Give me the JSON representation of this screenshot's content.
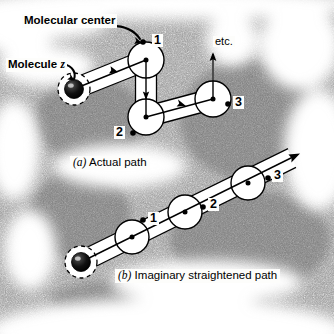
{
  "figure": {
    "background_color": "#ffffff",
    "ink_color": "#000000"
  },
  "callouts": [
    {
      "id": "molecular-center",
      "text": "Molecular center",
      "x": 22,
      "y": 14
    },
    {
      "id": "molecule-z",
      "text": "Molecule ",
      "italic_suffix": "z",
      "x": 6,
      "y": 58
    },
    {
      "id": "etc",
      "text": "etc.",
      "x": 213,
      "y": 36
    }
  ],
  "captions": [
    {
      "id": "panel-a",
      "marker": "(a)",
      "text": " Actual path",
      "x": 70,
      "y": 156
    },
    {
      "id": "panel-b",
      "marker": "(b)",
      "text": " Imaginary straightened path",
      "x": 115,
      "y": 269
    }
  ],
  "panel_a": {
    "name": "actual-path",
    "molecule": {
      "cx": 74,
      "cy": 89,
      "r": 9.5,
      "halo_r": 16
    },
    "nodes": [
      {
        "label": "1",
        "cx": 146,
        "cy": 60,
        "r": 18,
        "dot_x": 143,
        "dot_y": 42,
        "label_x": 152,
        "label_y": 34
      },
      {
        "label": "2",
        "cx": 146,
        "cy": 117,
        "r": 18,
        "dot_x": 133,
        "dot_y": 133,
        "label_x": 114,
        "label_y": 126
      },
      {
        "label": "3",
        "cx": 213,
        "cy": 99,
        "r": 18,
        "dot_x": 228,
        "dot_y": 104,
        "label_x": 233,
        "label_y": 96
      }
    ],
    "segments": [
      {
        "from": "molecule",
        "to": "1",
        "arrow": true
      },
      {
        "from": "1",
        "to": "2",
        "arrow": true
      },
      {
        "from": "2",
        "to": "3",
        "arrow": true
      },
      {
        "from": "3",
        "to": "etc",
        "arrow": true
      }
    ]
  },
  "panel_b": {
    "name": "imaginary-straightened-path",
    "molecule": {
      "cx": 81,
      "cy": 262,
      "r": 9.5,
      "halo_r": 16
    },
    "nodes": [
      {
        "label": "1",
        "cx": 132,
        "cy": 237,
        "r": 17,
        "dot_x": 143,
        "dot_y": 220,
        "label_x": 148,
        "label_y": 212
      },
      {
        "label": "2",
        "cx": 185,
        "cy": 212,
        "r": 17,
        "dot_x": 203,
        "dot_y": 207,
        "label_x": 208,
        "label_y": 198
      },
      {
        "label": "3",
        "cx": 248,
        "cy": 183,
        "r": 17,
        "dot_x": 268,
        "dot_y": 178,
        "label_x": 272,
        "label_y": 169
      }
    ],
    "arrow_end": {
      "x": 300,
      "y": 153
    }
  }
}
